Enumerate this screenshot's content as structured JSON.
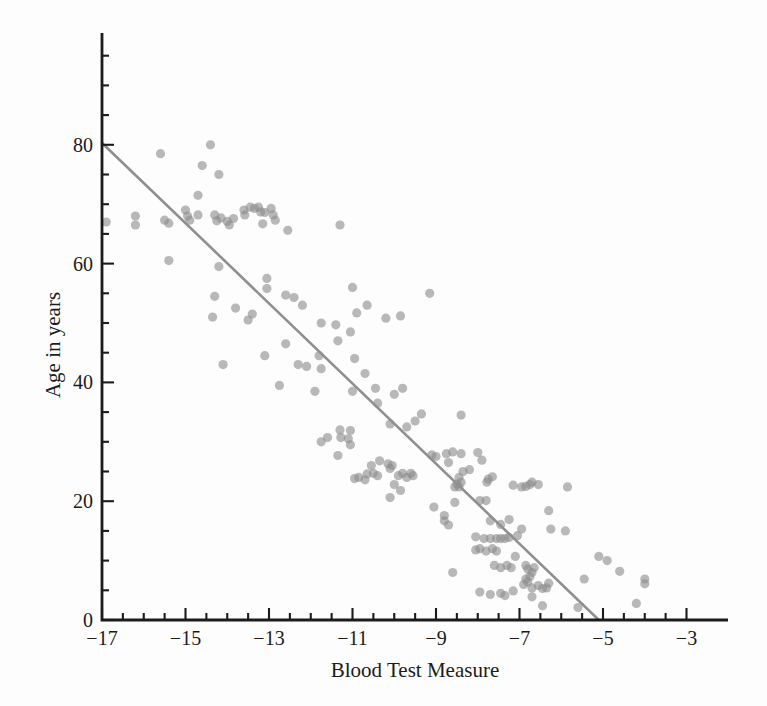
{
  "chart_data": {
    "type": "scatter",
    "title": "",
    "xlabel": "Blood Test Measure",
    "ylabel": "Age in years",
    "xlim": [
      -17,
      -2
    ],
    "ylim": [
      0,
      99
    ],
    "grid": false,
    "legend": null,
    "x_major_ticks": [
      -17,
      -15,
      -13,
      -11,
      -9,
      -7,
      -5,
      -3
    ],
    "x_tick_labels": [
      "−17",
      "−15",
      "−13",
      "−11",
      "−9",
      "−7",
      "−5",
      "−3"
    ],
    "x_minor_step": 0.5,
    "x_minor_range": [
      -17,
      -3
    ],
    "y_major_ticks": [
      0,
      20,
      40,
      60,
      80
    ],
    "y_tick_labels": [
      "0",
      "20",
      "40",
      "60",
      "80"
    ],
    "y_minor_step": 5,
    "y_minor_range": [
      0,
      95
    ],
    "regression_line": {
      "x1": -17,
      "y1": 80.3,
      "x2": -5.1,
      "y2": 0
    },
    "colors": {
      "point": "#8a8a8a",
      "point_opacity": 0.6,
      "line": "#8f8f8f",
      "axis": "#1b1b1b",
      "text": "#1b1b1b",
      "background": "#fdfdfd"
    },
    "points": [
      [
        -15.6,
        78.5
      ],
      [
        -14.4,
        80.0
      ],
      [
        -14.6,
        76.5
      ],
      [
        -14.2,
        75.0
      ],
      [
        -14.7,
        71.5
      ],
      [
        -16.9,
        67.0
      ],
      [
        -16.2,
        68.0
      ],
      [
        -16.2,
        66.5
      ],
      [
        -15.5,
        67.3
      ],
      [
        -15.4,
        66.8
      ],
      [
        -15.0,
        69.0
      ],
      [
        -14.95,
        68.0
      ],
      [
        -14.9,
        67.3
      ],
      [
        -14.7,
        68.2
      ],
      [
        -14.3,
        68.2
      ],
      [
        -14.25,
        67.2
      ],
      [
        -14.15,
        67.7
      ],
      [
        -14.0,
        67.1
      ],
      [
        -13.95,
        66.5
      ],
      [
        -13.85,
        67.6
      ],
      [
        -13.6,
        69.0
      ],
      [
        -13.58,
        68.2
      ],
      [
        -13.45,
        69.5
      ],
      [
        -13.35,
        69.3
      ],
      [
        -13.25,
        69.5
      ],
      [
        -13.2,
        68.7
      ],
      [
        -13.1,
        68.6
      ],
      [
        -12.95,
        69.3
      ],
      [
        -12.9,
        68.2
      ],
      [
        -12.85,
        67.3
      ],
      [
        -13.15,
        66.7
      ],
      [
        -12.55,
        65.6
      ],
      [
        -11.3,
        66.5
      ],
      [
        -15.4,
        60.5
      ],
      [
        -14.2,
        59.5
      ],
      [
        -13.05,
        57.5
      ],
      [
        -13.05,
        55.8
      ],
      [
        -14.3,
        54.5
      ],
      [
        -12.6,
        54.7
      ],
      [
        -11.0,
        56.0
      ],
      [
        -9.15,
        55.0
      ],
      [
        -13.8,
        52.5
      ],
      [
        -13.5,
        50.5
      ],
      [
        -13.4,
        51.5
      ],
      [
        -14.35,
        51.0
      ],
      [
        -12.4,
        54.3
      ],
      [
        -12.2,
        53.0
      ],
      [
        -10.65,
        53.0
      ],
      [
        -10.9,
        51.7
      ],
      [
        -11.75,
        50.0
      ],
      [
        -11.4,
        49.7
      ],
      [
        -10.2,
        50.8
      ],
      [
        -9.85,
        51.2
      ],
      [
        -12.6,
        46.5
      ],
      [
        -13.1,
        44.5
      ],
      [
        -14.1,
        43.0
      ],
      [
        -11.05,
        48.5
      ],
      [
        -11.35,
        47.0
      ],
      [
        -11.8,
        44.5
      ],
      [
        -10.95,
        44.0
      ],
      [
        -12.3,
        43.0
      ],
      [
        -12.1,
        42.7
      ],
      [
        -11.75,
        42.3
      ],
      [
        -10.7,
        41.5
      ],
      [
        -12.75,
        39.5
      ],
      [
        -11.9,
        38.5
      ],
      [
        -11.0,
        38.5
      ],
      [
        -10.45,
        39.0
      ],
      [
        -10.0,
        38.0
      ],
      [
        -9.8,
        39.0
      ],
      [
        -10.4,
        36.5
      ],
      [
        -9.35,
        34.7
      ],
      [
        -8.4,
        34.5
      ],
      [
        -10.1,
        33.0
      ],
      [
        -9.7,
        32.5
      ],
      [
        -9.5,
        33.5
      ],
      [
        -11.3,
        32.0
      ],
      [
        -11.05,
        31.9
      ],
      [
        -11.75,
        30.0
      ],
      [
        -11.6,
        30.7
      ],
      [
        -11.28,
        30.7
      ],
      [
        -11.1,
        30.5
      ],
      [
        -11.05,
        29.5
      ],
      [
        -11.35,
        27.7
      ],
      [
        -9.1,
        27.8
      ],
      [
        -9.0,
        27.5
      ],
      [
        -8.75,
        28.0
      ],
      [
        -8.6,
        28.3
      ],
      [
        -8.4,
        28.0
      ],
      [
        -8.0,
        28.2
      ],
      [
        -7.9,
        26.9
      ],
      [
        -8.7,
        26.5
      ],
      [
        -8.35,
        25.0
      ],
      [
        -8.2,
        25.3
      ],
      [
        -10.55,
        26.0
      ],
      [
        -10.35,
        26.8
      ],
      [
        -10.15,
        26.3
      ],
      [
        -10.1,
        25.5
      ],
      [
        -10.05,
        26.0
      ],
      [
        -10.65,
        24.6
      ],
      [
        -10.5,
        24.7
      ],
      [
        -10.4,
        24.3
      ],
      [
        -10.85,
        24.0
      ],
      [
        -10.7,
        23.6
      ],
      [
        -10.95,
        23.8
      ],
      [
        -9.9,
        24.3
      ],
      [
        -9.8,
        24.7
      ],
      [
        -9.7,
        24.0
      ],
      [
        -9.6,
        24.7
      ],
      [
        -9.55,
        24.3
      ],
      [
        -10.0,
        22.8
      ],
      [
        -9.85,
        21.8
      ],
      [
        -10.1,
        20.6
      ],
      [
        -8.45,
        24.0
      ],
      [
        -8.4,
        23.2
      ],
      [
        -8.5,
        22.9
      ],
      [
        -8.55,
        22.4
      ],
      [
        -8.45,
        22.4
      ],
      [
        -7.75,
        23.7
      ],
      [
        -7.65,
        24.1
      ],
      [
        -7.78,
        23.2
      ],
      [
        -7.15,
        22.7
      ],
      [
        -6.95,
        22.4
      ],
      [
        -6.85,
        22.5
      ],
      [
        -6.75,
        22.8
      ],
      [
        -6.7,
        23.2
      ],
      [
        -6.55,
        22.8
      ],
      [
        -5.85,
        22.4
      ],
      [
        -9.05,
        19.0
      ],
      [
        -8.55,
        19.8
      ],
      [
        -8.8,
        17.6
      ],
      [
        -8.8,
        16.7
      ],
      [
        -8.7,
        16.0
      ],
      [
        -7.95,
        20.1
      ],
      [
        -7.8,
        20.1
      ],
      [
        -7.7,
        16.7
      ],
      [
        -7.45,
        16.1
      ],
      [
        -7.25,
        16.9
      ],
      [
        -6.3,
        18.4
      ],
      [
        -7.85,
        13.7
      ],
      [
        -7.7,
        13.7
      ],
      [
        -7.55,
        13.7
      ],
      [
        -7.45,
        13.7
      ],
      [
        -7.35,
        13.7
      ],
      [
        -7.25,
        13.9
      ],
      [
        -7.05,
        14.2
      ],
      [
        -6.95,
        15.3
      ],
      [
        -6.25,
        15.3
      ],
      [
        -5.9,
        15.0
      ],
      [
        -8.05,
        14.0
      ],
      [
        -7.95,
        12.0
      ],
      [
        -7.8,
        11.6
      ],
      [
        -7.65,
        12.0
      ],
      [
        -7.55,
        11.6
      ],
      [
        -7.1,
        10.7
      ],
      [
        -8.05,
        11.8
      ],
      [
        -7.6,
        9.2
      ],
      [
        -7.45,
        8.8
      ],
      [
        -7.3,
        9.2
      ],
      [
        -7.2,
        8.8
      ],
      [
        -6.85,
        9.2
      ],
      [
        -6.8,
        8.6
      ],
      [
        -6.7,
        8.0
      ],
      [
        -6.65,
        8.8
      ],
      [
        -8.6,
        8.0
      ],
      [
        -6.75,
        7.3
      ],
      [
        -6.85,
        6.9
      ],
      [
        -6.8,
        6.4
      ],
      [
        -6.9,
        6.0
      ],
      [
        -6.7,
        5.4
      ],
      [
        -6.55,
        5.8
      ],
      [
        -6.45,
        5.3
      ],
      [
        -6.35,
        5.4
      ],
      [
        -6.3,
        6.2
      ],
      [
        -7.15,
        4.9
      ],
      [
        -7.7,
        4.3
      ],
      [
        -7.45,
        4.5
      ],
      [
        -7.35,
        4.1
      ],
      [
        -7.95,
        4.7
      ],
      [
        -6.45,
        2.4
      ],
      [
        -6.7,
        3.9
      ],
      [
        -5.6,
        2.1
      ],
      [
        -5.45,
        6.9
      ],
      [
        -5.1,
        10.7
      ],
      [
        -4.9,
        10.0
      ],
      [
        -4.6,
        8.2
      ],
      [
        -4.0,
        6.9
      ],
      [
        -4.0,
        6.1
      ],
      [
        -4.2,
        2.8
      ]
    ]
  }
}
